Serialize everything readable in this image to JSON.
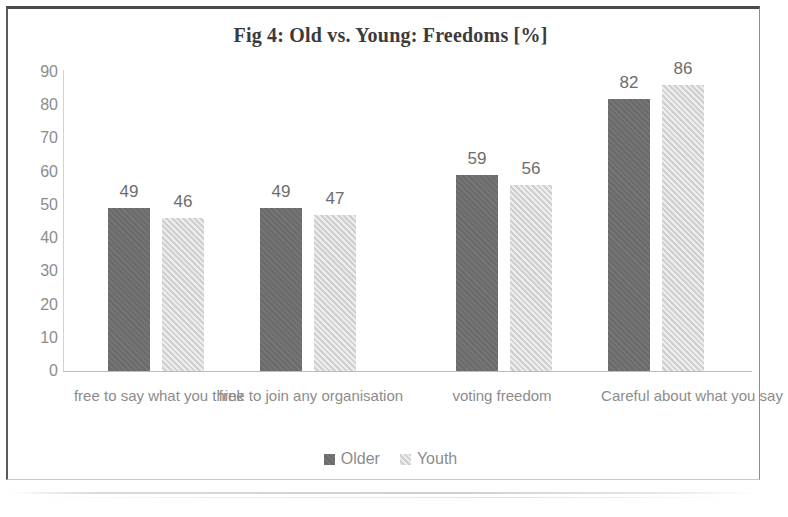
{
  "chart_data": {
    "type": "bar",
    "title": "Fig 4: Old vs. Young: Freedoms [%]",
    "xlabel": "",
    "ylabel": "",
    "ylim": [
      0,
      90
    ],
    "ytick_step": 10,
    "yticks": [
      "90",
      "80",
      "70",
      "60",
      "50",
      "40",
      "30",
      "20",
      "10",
      "0"
    ],
    "grid": false,
    "legend_position": "bottom-center",
    "categories": [
      "free to say what you think",
      "free to join any organisation",
      "voting freedom",
      "Careful about what you say"
    ],
    "series": [
      {
        "name": "Older",
        "color": "#6f6f6f",
        "values": [
          49,
          49,
          59,
          82
        ]
      },
      {
        "name": "Youth",
        "color": "#d7d7d7",
        "values": [
          46,
          47,
          56,
          86
        ]
      }
    ]
  },
  "colors": {
    "older": "#6f6f6f",
    "youth": "#d7d7d7",
    "text_gray": "#8c8c8c",
    "title_gray": "#3b3b3b",
    "frame": "#4a4a4a"
  }
}
